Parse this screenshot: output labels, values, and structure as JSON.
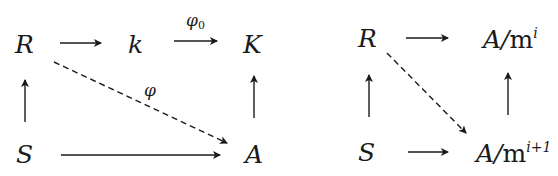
{
  "diagrams": [
    {
      "id": "left",
      "nodes": {
        "R": "R",
        "k": "k",
        "K": "K",
        "S": "S",
        "A": "A"
      },
      "arrows": [
        {
          "from": "R",
          "to": "k",
          "style": "solid",
          "label": ""
        },
        {
          "from": "k",
          "to": "K",
          "style": "solid",
          "label": "φ₀"
        },
        {
          "from": "S",
          "to": "R",
          "style": "solid",
          "label": ""
        },
        {
          "from": "A",
          "to": "K",
          "style": "solid",
          "label": ""
        },
        {
          "from": "S",
          "to": "A",
          "style": "solid",
          "label": ""
        },
        {
          "from": "R",
          "to": "A",
          "style": "dashed",
          "label": "φ"
        }
      ],
      "labels": {
        "phi0_base": "φ",
        "phi0_sub": "0",
        "phi": "φ"
      }
    },
    {
      "id": "right",
      "nodes": {
        "R": "R",
        "S": "S",
        "top_right_base": "A/",
        "top_right_m": "m",
        "top_right_exp": "i",
        "bottom_right_base": "A/",
        "bottom_right_m": "m",
        "bottom_right_exp": "i+1"
      },
      "arrows": [
        {
          "from": "R",
          "to": "A/m^i",
          "style": "solid",
          "label": ""
        },
        {
          "from": "S",
          "to": "R",
          "style": "solid",
          "label": ""
        },
        {
          "from": "A/m^(i+1)",
          "to": "A/m^i",
          "style": "solid",
          "label": ""
        },
        {
          "from": "S",
          "to": "A/m^(i+1)",
          "style": "solid",
          "label": ""
        },
        {
          "from": "R",
          "to": "A/m^(i+1)",
          "style": "dashed",
          "label": ""
        }
      ]
    }
  ],
  "colors": {
    "ink": "#1a1a1a",
    "background": "#ffffff"
  }
}
